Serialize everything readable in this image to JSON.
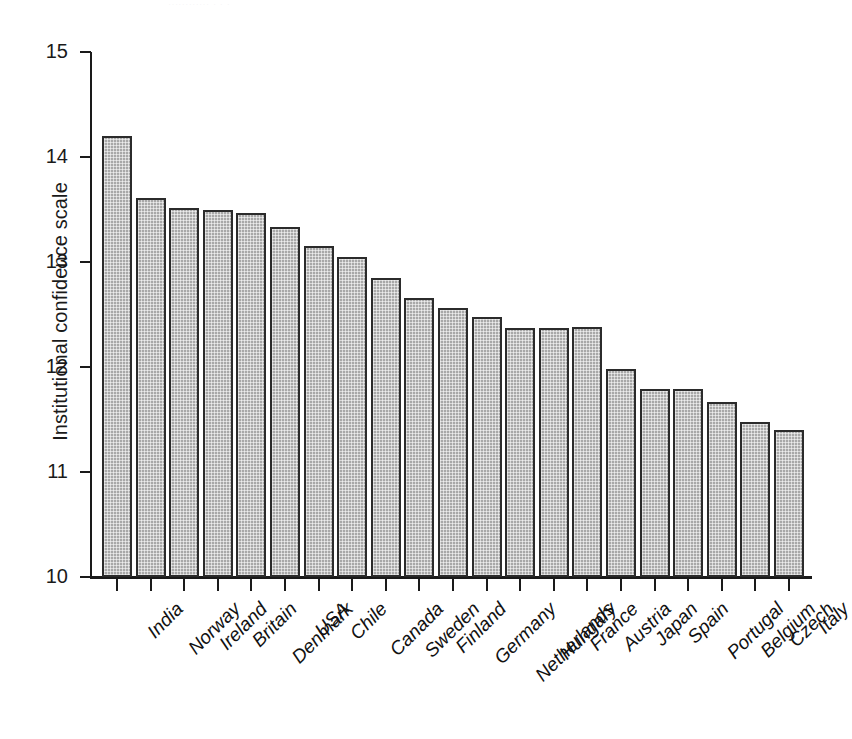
{
  "top_scrap": "............  .  .   .",
  "chart_data": {
    "type": "bar",
    "title": "",
    "subtitle": "",
    "xlabel": "",
    "ylabel": "Institutional confidence scale",
    "ylim": [
      10,
      15
    ],
    "yticks": [
      10,
      11,
      12,
      13,
      14,
      15
    ],
    "ytick_labels": [
      "10",
      "11",
      "12",
      "13",
      "14",
      "15"
    ],
    "grid": false,
    "legend": null,
    "bar_fill": "#a8a8a8",
    "bar_edge": "#2b2b2b",
    "categories": [
      "India",
      "Norway",
      "Ireland",
      "Britain",
      "Denmark",
      "USA",
      "Chile",
      "Canada",
      "Sweden",
      "Finland",
      "Germany",
      "Netherlands",
      "Hungary",
      "France",
      "Austria",
      "Japan",
      "Spain",
      "Portugal",
      "Belgium",
      "Czech",
      "Italy"
    ],
    "values": [
      14.2,
      13.61,
      13.51,
      13.5,
      13.47,
      13.33,
      13.15,
      13.05,
      12.85,
      12.66,
      12.56,
      12.48,
      12.37,
      12.37,
      12.38,
      11.98,
      11.79,
      11.79,
      11.67,
      11.48,
      11.4
    ]
  }
}
